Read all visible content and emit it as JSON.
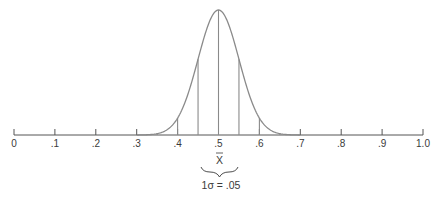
{
  "chart_data": {
    "type": "line",
    "title": "",
    "xlabel": "",
    "ylabel": "",
    "xlim": [
      0,
      1.0
    ],
    "grid": false,
    "legend": null,
    "tick_values": [
      0,
      0.1,
      0.2,
      0.3,
      0.4,
      0.5,
      0.6,
      0.7,
      0.8,
      0.9,
      1.0
    ],
    "tick_labels": [
      "0",
      ".1",
      ".2",
      ".3",
      ".4",
      ".5",
      ".6",
      ".7",
      ".8",
      ".9",
      "1.0"
    ],
    "mean": 0.5,
    "sd": 0.05,
    "curve_support": [
      0.3,
      0.7
    ],
    "vertical_lines_x": [
      0.35,
      0.4,
      0.45,
      0.5,
      0.55,
      0.6,
      0.65
    ],
    "annotations": {
      "mean_symbol": "X̄",
      "sd_label": "1σ = .05"
    }
  },
  "labels": {
    "mean_symbol": "X",
    "sd_label": "1σ = .05"
  },
  "style": {
    "line_color": "#8a8a8a",
    "axis_color": "#555555",
    "text_color": "#3a3a3a"
  }
}
